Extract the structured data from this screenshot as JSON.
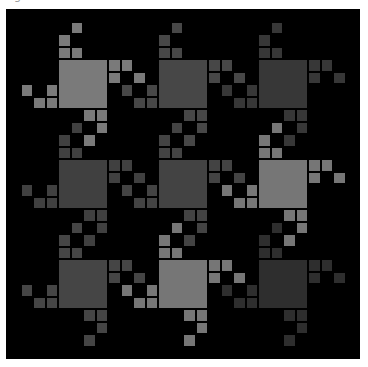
{
  "caption": "g",
  "tessellation": {
    "origin_x": 52,
    "origin_y": 50,
    "unit": 12.5,
    "period": 100,
    "background": "#000000",
    "motif_colors": [
      [
        "#7a7a7a",
        "#474747",
        "#373737"
      ],
      [
        "#404040",
        "#434343",
        "#767676"
      ],
      [
        "#454545",
        "#767676",
        "#2e2e2e"
      ]
    ],
    "motif_cells": {
      "body": [
        [
          0,
          0,
          4,
          4
        ]
      ],
      "top_arm": [
        [
          0,
          -2,
          1,
          1
        ],
        [
          0,
          -1,
          1,
          1
        ],
        [
          1,
          -1,
          1,
          1
        ],
        [
          1,
          -3,
          1,
          1
        ]
      ],
      "right_arm": [
        [
          4,
          0,
          1,
          1
        ],
        [
          5,
          0,
          1,
          1
        ],
        [
          4,
          1,
          1,
          1
        ],
        [
          6,
          1,
          1,
          1
        ]
      ],
      "bottom_arm": [
        [
          2,
          4,
          1,
          1
        ],
        [
          3,
          4,
          1,
          1
        ],
        [
          3,
          5,
          1,
          1
        ],
        [
          2,
          6,
          1,
          1
        ]
      ],
      "left_arm": [
        [
          -1,
          3,
          1,
          1
        ],
        [
          -2,
          3,
          1,
          1
        ],
        [
          -1,
          2,
          1,
          1
        ],
        [
          -3,
          2,
          1,
          1
        ]
      ]
    }
  }
}
